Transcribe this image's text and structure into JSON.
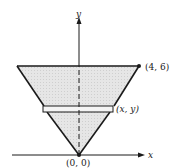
{
  "diagram": {
    "type": "cone-cross-section",
    "axes": {
      "x_label": "x",
      "y_label": "y"
    },
    "points": {
      "origin": "(0, 0)",
      "top_right": "(4, 6)",
      "strip_point": "(x, y)"
    },
    "colors": {
      "fill": "#e3e3e3",
      "stroke": "#1a1a1a",
      "strip_fill": "#f4f4f4"
    }
  }
}
